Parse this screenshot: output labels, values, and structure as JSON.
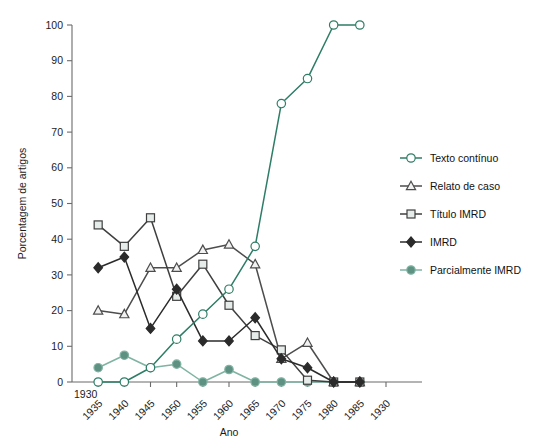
{
  "chart_data": {
    "type": "line",
    "title": "",
    "xlabel": "Ano",
    "ylabel": "Porcentagem de artigos",
    "xlim": [
      1930,
      1990
    ],
    "ylim": [
      0,
      100
    ],
    "grid": false,
    "legend_position": "right",
    "x_tick_labels": [
      "1930",
      "1935",
      "1940",
      "1945",
      "1950",
      "1955",
      "1960",
      "1965",
      "1970",
      "1975",
      "1980",
      "1985",
      "1930"
    ],
    "x_tick_values": [
      1930,
      1935,
      1940,
      1945,
      1950,
      1955,
      1960,
      1965,
      1970,
      1975,
      1980,
      1985,
      1990
    ],
    "y_tick_labels": [
      "0",
      "10",
      "20",
      "30",
      "40",
      "50",
      "60",
      "70",
      "80",
      "90",
      "100"
    ],
    "y_tick_values": [
      0,
      10,
      20,
      30,
      40,
      50,
      60,
      70,
      80,
      90,
      100
    ],
    "x": [
      1935,
      1940,
      1945,
      1950,
      1955,
      1960,
      1965,
      1970,
      1975,
      1980,
      1985
    ],
    "series": [
      {
        "name": "Texto contínuo",
        "marker": "open-circle",
        "color": "#2e7d66",
        "fill": "#ffffff",
        "values": [
          0,
          0,
          4,
          12,
          19,
          26,
          38,
          78,
          85,
          100,
          100
        ]
      },
      {
        "name": "Relato de caso",
        "marker": "open-triangle",
        "color": "#4d4d4d",
        "fill": "#f2f2f2",
        "values": [
          20,
          19,
          32,
          32,
          37,
          38.5,
          33,
          6.5,
          11,
          0,
          0
        ]
      },
      {
        "name": "Título IMRD",
        "marker": "open-square",
        "color": "#3f3f3f",
        "fill": "#e6ece9",
        "values": [
          44,
          38,
          46,
          24,
          33,
          21.5,
          13,
          9,
          0.5,
          0,
          0
        ]
      },
      {
        "name": "IMRD",
        "marker": "filled-diamond",
        "color": "#2b2b2b",
        "fill": "#2b2b2b",
        "values": [
          32,
          35,
          15,
          26,
          11.5,
          11.5,
          18,
          6.5,
          4,
          0,
          0
        ]
      },
      {
        "name": "Parcialmente IMRD",
        "marker": "filled-circle",
        "color": "#7fb3a3",
        "fill": "#5f9183",
        "values": [
          4,
          7.5,
          4,
          5,
          0,
          3.5,
          0,
          0,
          0,
          0,
          0
        ]
      }
    ]
  },
  "legend": {
    "entries": [
      {
        "label": "Texto contínuo"
      },
      {
        "label": "Relato de caso"
      },
      {
        "label": "Título IMRD"
      },
      {
        "label": "IMRD"
      },
      {
        "label": "Parcialmente IMRD"
      }
    ]
  },
  "colors": {
    "accent_green": "#2e7d66",
    "teal": "#5f9183",
    "dark_gray": "#3f3f3f",
    "axis": "#6b6b6b"
  }
}
